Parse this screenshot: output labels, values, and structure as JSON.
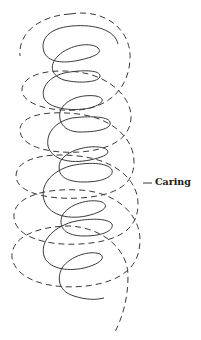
{
  "diagram": {
    "type": "helix-illustration",
    "label": "Caring",
    "colors": {
      "background": "#ffffff",
      "stroke": "#3a3a3a",
      "label": "#1a1a1a"
    },
    "elements": [
      {
        "name": "inner-coil",
        "style": "solid"
      },
      {
        "name": "outer-coil",
        "style": "dashed"
      },
      {
        "name": "leader-line",
        "style": "solid",
        "target": "outer-coil"
      }
    ]
  }
}
